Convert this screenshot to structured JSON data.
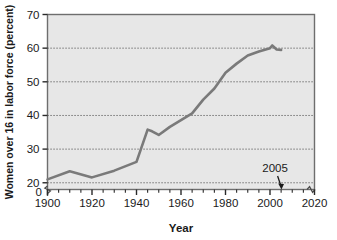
{
  "chart_data": {
    "type": "line",
    "title": "",
    "xlabel": "Year",
    "ylabel": "Women over 16 in labor force (percent)",
    "xlim": [
      1900,
      2020
    ],
    "ylim": [
      18,
      70
    ],
    "y_axis_break": true,
    "x_axis_break": true,
    "grid": true,
    "grid_style": "dotted-horizontal",
    "legend": "none",
    "x_ticks": [
      1900,
      1920,
      1940,
      1960,
      1980,
      2000,
      2020
    ],
    "x_tick_labels": [
      "1900",
      "1920",
      "1940",
      "1960",
      "1980",
      "2000",
      "2020"
    ],
    "x_minor_tick_interval": 5,
    "y_ticks": [
      20,
      30,
      40,
      50,
      60,
      70
    ],
    "y_tick_labels": [
      "20",
      "30",
      "40",
      "50",
      "60",
      "70"
    ],
    "y_zero_label": "0",
    "series": [
      {
        "name": "Women over 16 in labor force",
        "color": "#7a7a7a",
        "x": [
          1900,
          1910,
          1920,
          1930,
          1940,
          1945,
          1947,
          1950,
          1955,
          1960,
          1965,
          1970,
          1975,
          1980,
          1985,
          1990,
          1995,
          2000,
          2001,
          2003,
          2005
        ],
        "values": [
          21.0,
          23.4,
          21.6,
          23.6,
          26.2,
          35.8,
          35.3,
          34.2,
          36.6,
          38.6,
          40.6,
          44.7,
          48.0,
          52.7,
          55.4,
          57.8,
          59.0,
          60.0,
          60.8,
          59.6,
          59.5
        ]
      }
    ],
    "annotations": [
      {
        "name": "year-2005-callout",
        "text": "2005",
        "x": 2005,
        "arrow": "down",
        "points_to_axis": true
      }
    ],
    "colors": {
      "plot_background": "#e7e7e7",
      "plot_border": "#6e6e6e",
      "line": "#7a7a7a",
      "grid": "#4a4a4a",
      "text": "#1a1a1a",
      "page_background": "#ffffff"
    }
  }
}
